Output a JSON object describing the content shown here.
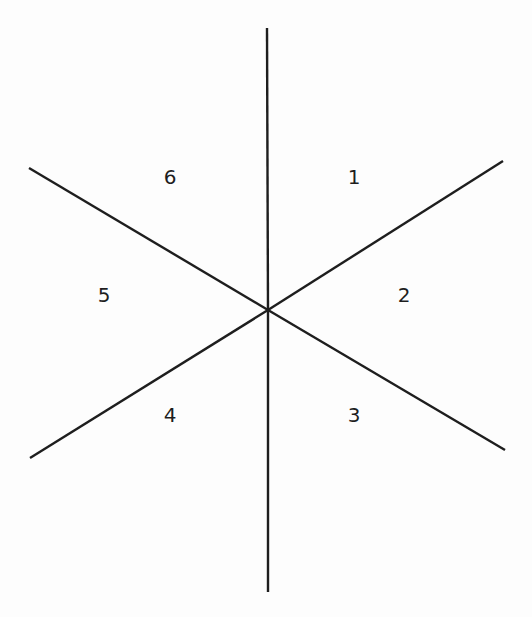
{
  "diagram": {
    "line_color": "#1e1e1e",
    "background_color": "#fdfdfd",
    "rays": [
      {
        "id": "ray-up",
        "direction_deg": 90
      },
      {
        "id": "ray-upper-right",
        "direction_deg": 30
      },
      {
        "id": "ray-lower-right",
        "direction_deg": -30
      },
      {
        "id": "ray-down",
        "direction_deg": -90
      },
      {
        "id": "ray-lower-left",
        "direction_deg": -150
      },
      {
        "id": "ray-upper-left",
        "direction_deg": 150
      }
    ],
    "sectors": [
      {
        "label": "1",
        "position": "upper-right"
      },
      {
        "label": "2",
        "position": "right"
      },
      {
        "label": "3",
        "position": "lower-right"
      },
      {
        "label": "4",
        "position": "lower-left"
      },
      {
        "label": "5",
        "position": "left"
      },
      {
        "label": "6",
        "position": "upper-left"
      }
    ]
  }
}
